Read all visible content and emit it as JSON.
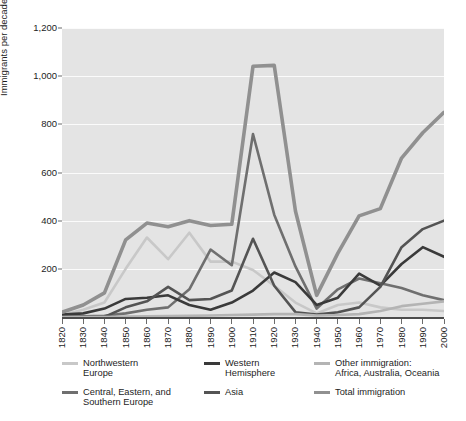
{
  "chart_data": {
    "type": "line",
    "title": "",
    "xlabel": "",
    "ylabel": "Immigrants per decade\n(thousands)",
    "xlim": [
      1820,
      2000
    ],
    "ylim": [
      0,
      1200
    ],
    "grid": true,
    "legend_position": "bottom",
    "x": [
      1820,
      1830,
      1840,
      1850,
      1860,
      1870,
      1880,
      1890,
      1900,
      1910,
      1920,
      1930,
      1940,
      1950,
      1960,
      1970,
      1980,
      1990,
      2000
    ],
    "xtick_labels": [
      "1820",
      "1830",
      "1840",
      "1850",
      "1860",
      "1870",
      "1880",
      "1890",
      "1900",
      "1910",
      "1920",
      "1930",
      "1940",
      "1950",
      "1960",
      "1970",
      "1980",
      "1990",
      "2000"
    ],
    "ytick_labels": [
      "1,200",
      "1,000",
      "800",
      "600",
      "400",
      "200"
    ],
    "ytick_values": [
      1200,
      1000,
      800,
      600,
      400,
      200
    ],
    "series": [
      {
        "name": "Northwestern Europe",
        "color": "#c8c8c8",
        "width": 2.6,
        "values": [
          8,
          30,
          60,
          200,
          330,
          240,
          350,
          230,
          230,
          195,
          130,
          60,
          15,
          50,
          60,
          40,
          30,
          30,
          25
        ]
      },
      {
        "name": "Central, Eastern, and Southern Europe",
        "color": "#6f6f6f",
        "width": 2.6,
        "values": [
          2,
          3,
          5,
          15,
          30,
          40,
          115,
          280,
          215,
          760,
          425,
          210,
          35,
          115,
          160,
          140,
          120,
          90,
          70
        ]
      },
      {
        "name": "Western Hemisphere",
        "color": "#3a3a3a",
        "width": 2.6,
        "values": [
          10,
          15,
          35,
          75,
          80,
          90,
          50,
          30,
          60,
          110,
          185,
          145,
          50,
          80,
          180,
          130,
          220,
          290,
          250
        ]
      },
      {
        "name": "Asia",
        "color": "#545454",
        "width": 2.6,
        "values": [
          0,
          0,
          0,
          40,
          65,
          125,
          70,
          75,
          110,
          325,
          130,
          20,
          10,
          20,
          40,
          125,
          290,
          365,
          400
        ]
      },
      {
        "name": "Other immigration: Africa, Australia, Oceania",
        "color": "#b4b4b4",
        "width": 2.6,
        "values": [
          0,
          0,
          0,
          2,
          3,
          4,
          5,
          6,
          8,
          10,
          12,
          12,
          6,
          8,
          12,
          25,
          45,
          55,
          65
        ]
      },
      {
        "name": "Total immigration",
        "color": "#909090",
        "width": 3.6,
        "values": [
          20,
          50,
          100,
          320,
          390,
          375,
          400,
          380,
          385,
          1041,
          1045,
          440,
          90,
          265,
          420,
          450,
          660,
          765,
          850
        ]
      }
    ]
  },
  "axes": {
    "y_title": "Immigrants per decade\n(thousands)",
    "y_ticks": [
      "1,200",
      "1,000",
      "800",
      "600",
      "400",
      "200"
    ],
    "x_ticks": [
      "1820",
      "1830",
      "1840",
      "1850",
      "1860",
      "1870",
      "1880",
      "1890",
      "1900",
      "1910",
      "1920",
      "1930",
      "1940",
      "1950",
      "1960",
      "1970",
      "1980",
      "1990",
      "2000"
    ]
  },
  "legend": {
    "items": [
      {
        "label": "Northwestern\nEurope",
        "color": "#c8c8c8",
        "col": 0,
        "row": 0
      },
      {
        "label": "Central, Eastern, and\nSouthern Europe",
        "color": "#6f6f6f",
        "col": 0,
        "row": 1
      },
      {
        "label": "Western\nHemisphere",
        "color": "#3a3a3a",
        "col": 1,
        "row": 0
      },
      {
        "label": "Asia",
        "color": "#545454",
        "col": 1,
        "row": 1
      },
      {
        "label": "Other immigration:\nAfrica, Australia, Oceania",
        "color": "#b4b4b4",
        "col": 2,
        "row": 0
      },
      {
        "label": "Total immigration",
        "color": "#909090",
        "col": 2,
        "row": 1
      }
    ]
  },
  "colors": {
    "plot_background": "#e4e4e4",
    "gridline": "#fbfbfb",
    "axis": "#4c4c4c",
    "text": "#1d1d1d"
  }
}
